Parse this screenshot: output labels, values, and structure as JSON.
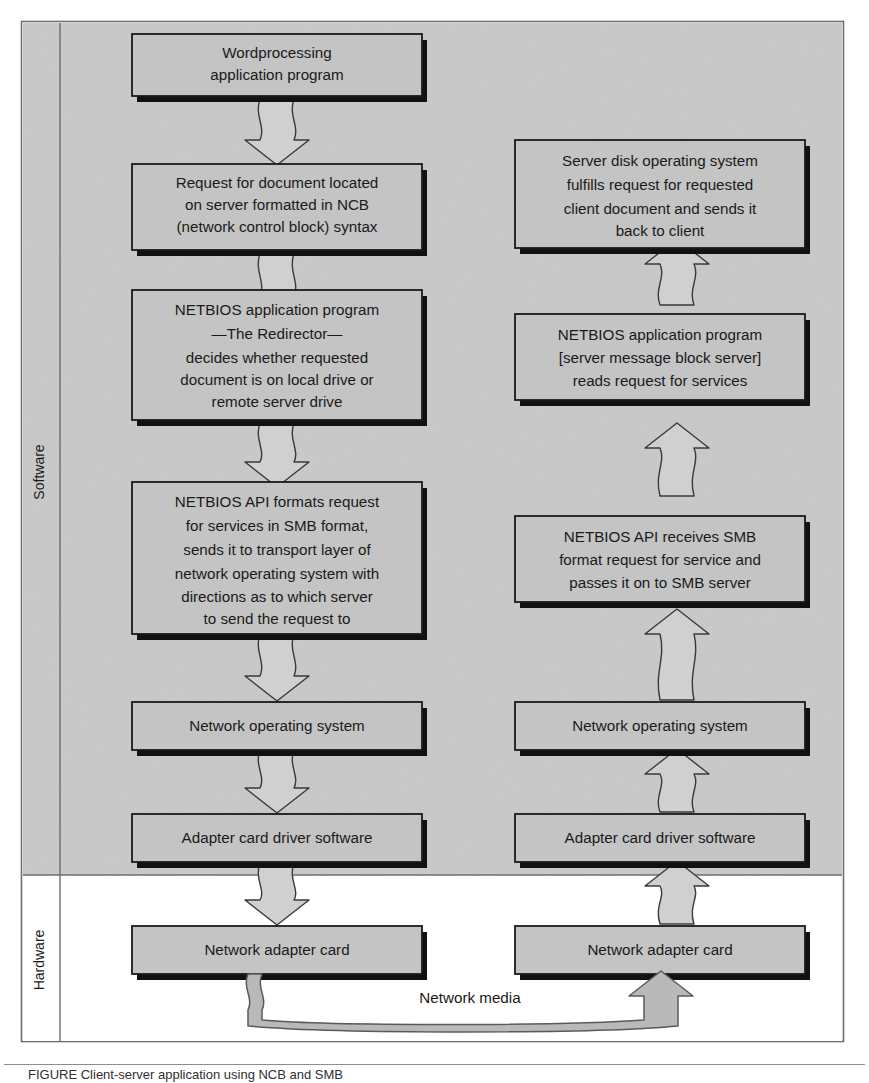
{
  "figure": {
    "zones": [
      {
        "id": "software",
        "label": "Software",
        "fill": "#c9c9c9"
      },
      {
        "id": "hardware",
        "label": "Hardware",
        "fill": "#ffffff"
      }
    ],
    "colors": {
      "panel_software": "#c9c9c9",
      "panel_hardware": "#ffffff",
      "box_fill": "#c4c4c4",
      "box_stroke": "#1a1a1a",
      "box_shadow": "#111111",
      "arrow_fill": "#d0d0d0",
      "arrow_stroke": "#3a3a3a",
      "cable_fill": "#b9b9b9",
      "cable_stroke": "#5a5a5a",
      "frame_stroke": "#6e6e6e",
      "text": "#1a1a1a"
    },
    "media_label": "Network media",
    "caption": "FIGURE   Client-server application using NCB and SMB"
  },
  "client_column": {
    "name": "client-flow",
    "direction": "downward",
    "boxes": [
      {
        "id": "client-1",
        "lines": [
          "Wordprocessing",
          "application program"
        ]
      },
      {
        "id": "client-2",
        "lines": [
          "Request for document located",
          "on server formatted in NCB",
          "(network control block) syntax"
        ]
      },
      {
        "id": "client-3",
        "lines": [
          "NETBIOS application program",
          "—The Redirector—",
          "decides whether requested",
          "document is on local drive or",
          "remote server drive"
        ]
      },
      {
        "id": "client-4",
        "lines": [
          "NETBIOS API formats request",
          "for services in SMB format,",
          "sends it to transport layer of",
          "network operating system with",
          "directions as to which server",
          "to send the request to"
        ]
      },
      {
        "id": "client-5",
        "lines": [
          "Network operating system"
        ]
      },
      {
        "id": "client-6",
        "lines": [
          "Adapter card driver software"
        ]
      },
      {
        "id": "client-7",
        "lines": [
          "Network adapter card"
        ]
      }
    ]
  },
  "server_column": {
    "name": "server-flow",
    "direction": "upward",
    "boxes": [
      {
        "id": "server-1",
        "lines": [
          "Server disk operating system",
          "fulfills request for requested",
          "client document and sends it",
          "back to client"
        ]
      },
      {
        "id": "server-2",
        "lines": [
          "NETBIOS application program",
          "[server message block server]",
          "reads request for services"
        ]
      },
      {
        "id": "server-3",
        "lines": [
          "NETBIOS API receives SMB",
          "format request for service and",
          "passes it on to SMB server"
        ]
      },
      {
        "id": "server-4",
        "lines": [
          "Network operating system"
        ]
      },
      {
        "id": "server-5",
        "lines": [
          "Adapter card driver software"
        ]
      },
      {
        "id": "server-6",
        "lines": [
          "Network adapter card"
        ]
      }
    ]
  }
}
